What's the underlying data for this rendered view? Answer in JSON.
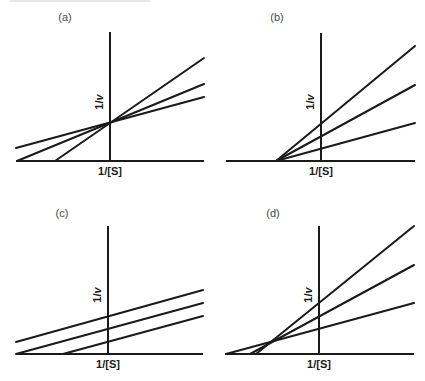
{
  "figure": {
    "axis_labels": {
      "x": "1/[S]",
      "y_prefix": "1/",
      "y_var": "v"
    },
    "colors": {
      "line": "#1a1a1a",
      "panel_label": "#4a4a4a",
      "background": "#ffffff"
    }
  },
  "panels": [
    {
      "id": "a",
      "label": "(a)",
      "pattern": "lines intersect on the y-axis (above x-axis)",
      "label_pos": [
        65,
        21
      ],
      "x_axis": {
        "x1": 16,
        "x2": 204,
        "y": 161
      },
      "y_axis": {
        "x": 110,
        "y1": 32,
        "y2": 161
      },
      "x_label_pos": [
        110,
        175
      ],
      "y_label_pos": [
        103,
        102
      ],
      "lines": [
        {
          "x1": 16,
          "y1": 148,
          "x2": 204,
          "y2": 97
        },
        {
          "x1": 17,
          "y1": 161,
          "x2": 204,
          "y2": 84
        },
        {
          "x1": 55,
          "y1": 161,
          "x2": 204,
          "y2": 58
        }
      ]
    },
    {
      "id": "b",
      "label": "(b)",
      "pattern": "lines intersect on the x-axis",
      "label_pos": [
        277,
        21
      ],
      "x_axis": {
        "x1": 226,
        "x2": 415,
        "y": 161
      },
      "y_axis": {
        "x": 321,
        "y1": 33,
        "y2": 161
      },
      "x_label_pos": [
        321,
        175
      ],
      "y_label_pos": [
        314,
        102
      ],
      "lines": [
        {
          "x1": 276,
          "y1": 161,
          "x2": 415,
          "y2": 123
        },
        {
          "x1": 276,
          "y1": 161,
          "x2": 415,
          "y2": 85
        },
        {
          "x1": 276,
          "y1": 161,
          "x2": 415,
          "y2": 46
        }
      ]
    },
    {
      "id": "c",
      "label": "(c)",
      "pattern": "parallel lines",
      "label_pos": [
        62,
        217
      ],
      "x_axis": {
        "x1": 16,
        "x2": 203,
        "y": 354
      },
      "y_axis": {
        "x": 108,
        "y1": 226,
        "y2": 354
      },
      "x_label_pos": [
        108,
        368
      ],
      "y_label_pos": [
        101,
        295
      ],
      "lines": [
        {
          "x1": 16,
          "y1": 342,
          "x2": 203,
          "y2": 290
        },
        {
          "x1": 16,
          "y1": 354,
          "x2": 203,
          "y2": 303
        },
        {
          "x1": 63,
          "y1": 354,
          "x2": 203,
          "y2": 316
        }
      ]
    },
    {
      "id": "d",
      "label": "(d)",
      "pattern": "lines intersect left of the y-axis, above the x-axis",
      "label_pos": [
        273,
        217
      ],
      "x_axis": {
        "x1": 225,
        "x2": 414,
        "y": 354
      },
      "y_axis": {
        "x": 319,
        "y1": 226,
        "y2": 354
      },
      "x_label_pos": [
        319,
        368
      ],
      "y_label_pos": [
        312,
        295
      ],
      "lines": [
        {
          "x1": 226,
          "y1": 354,
          "x2": 414,
          "y2": 303
        },
        {
          "x1": 250,
          "y1": 354,
          "x2": 414,
          "y2": 265
        },
        {
          "x1": 256,
          "y1": 354,
          "x2": 414,
          "y2": 226
        }
      ]
    }
  ]
}
